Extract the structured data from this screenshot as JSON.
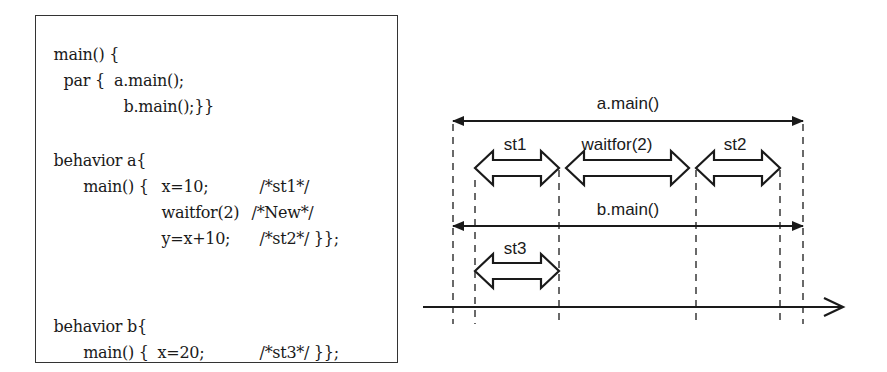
{
  "code": {
    "lines": [
      {
        "indent": "main() {",
        "stmt": "",
        "comment": ""
      },
      {
        "indent": "  par {  a.main();",
        "stmt": "",
        "comment": ""
      },
      {
        "indent": "         b.main();}}",
        "stmt": "",
        "comment": ""
      },
      {
        "indent": "",
        "stmt": "",
        "comment": ""
      },
      {
        "indent": "behavior a{",
        "stmt": "",
        "comment": ""
      },
      {
        "indent": "  main() {",
        "stmt": "x=10;",
        "comment": "/*st1*/"
      },
      {
        "indent": "",
        "stmt": "waitfor(2)",
        "comment": "/*New*/"
      },
      {
        "indent": "",
        "stmt": "y=x+10;",
        "comment": "/*st2*/ }};"
      },
      {
        "indent": "",
        "stmt": "",
        "comment": ""
      },
      {
        "indent": "behavior b{",
        "stmt": "",
        "comment": ""
      },
      {
        "indent": "  main() {",
        "stmt": "x=20;",
        "comment": "/*st3*/ }};"
      }
    ]
  },
  "timing_diagram": {
    "spans": [
      {
        "label": "a.main()",
        "kind": "line-arrow"
      },
      {
        "label": "b.main()",
        "kind": "line-arrow"
      }
    ],
    "blocks": [
      {
        "label": "st1"
      },
      {
        "label": "waitfor(2)"
      },
      {
        "label": "st2"
      },
      {
        "label": "st3"
      }
    ],
    "time_axis": {
      "direction": "right"
    }
  }
}
